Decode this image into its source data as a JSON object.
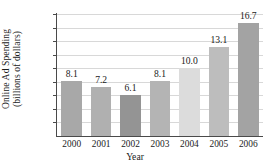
{
  "chart_data": {
    "type": "bar",
    "title": "",
    "xlabel": "Year",
    "ylabel": "Online Ad Spending (billions of dollars)",
    "ylabel_line1": "Online Ad Spending",
    "ylabel_line2": "(billions of dollars)",
    "categories": [
      "2000",
      "2001",
      "2002",
      "2003",
      "2004",
      "2005",
      "2006"
    ],
    "values": [
      8.1,
      7.2,
      6.1,
      8.1,
      10.0,
      13.1,
      16.7
    ],
    "value_labels": [
      "8.1",
      "7.2",
      "6.1",
      "8.1",
      "10.0",
      "13.1",
      "16.7"
    ],
    "bar_colors": [
      "#a8a8a8",
      "#b0b0b0",
      "#949494",
      "#b4b4b4",
      "#dcdcdc",
      "#bdbdbd",
      "#a3a3a3"
    ],
    "ylim": [
      0,
      18
    ],
    "ytick_values": [
      18,
      16,
      14,
      12,
      10,
      8,
      6,
      4,
      2
    ],
    "ytick_labels": [
      "$18",
      "$16",
      "$14",
      "$12",
      "$10",
      "$8",
      "$6",
      "$4",
      "$2"
    ],
    "grid": true,
    "grid_color": "#d8d8d8",
    "axis_color": "#4a4a4a",
    "background": "#ffffff",
    "legend": null
  }
}
